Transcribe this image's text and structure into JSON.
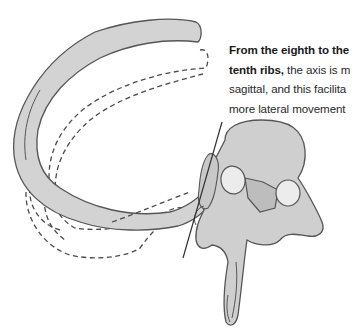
{
  "figure": {
    "parts": {
      "rib": "rib-icon",
      "rib_alt_position_1": "dashed-rib-outline",
      "rib_alt_position_2": "dashed-rib-outline",
      "vertebra": "vertebra-icon",
      "axis_line": "rotation-axis-line"
    },
    "colors": {
      "bone_fill": "#d2d2d2",
      "bone_fill_dark": "#bdbdbd",
      "facet_fill": "#ececec",
      "outline": "#555555",
      "dashed_outline": "#4a4a4a",
      "axis_line": "#333333",
      "background": "#ffffff"
    }
  },
  "caption": {
    "line1_bold": "From the eighth to the",
    "line2_bold": "tenth ribs,",
    "line2_rest": " the axis is m",
    "line3": "sagittal, and this facilita",
    "line4": "more lateral movement"
  }
}
